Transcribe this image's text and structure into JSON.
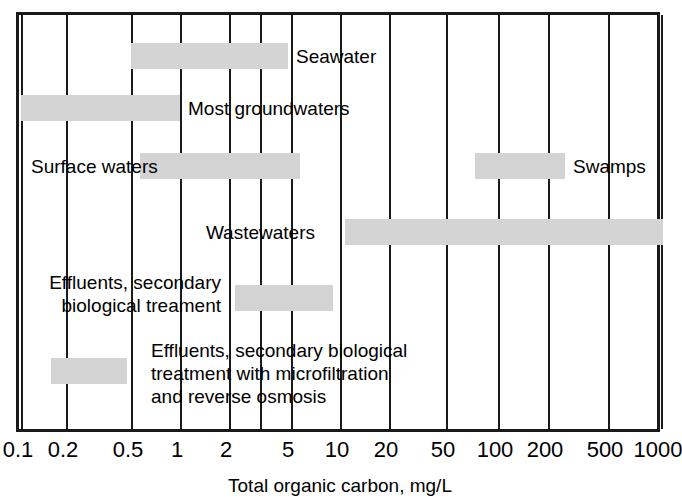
{
  "chart_data": {
    "type": "bar",
    "orientation": "horizontal",
    "title": "",
    "xlabel": "Total organic carbon, mg/L",
    "ylabel": "",
    "xscale": "log",
    "xlim": [
      0.1,
      1000
    ],
    "grid": true,
    "legend": "none",
    "tick_labels": [
      "0.1",
      "0.2",
      "0.5",
      "1",
      "2",
      "5",
      "10",
      "20",
      "50",
      "100",
      "200",
      "500",
      "1000"
    ],
    "tick_values": [
      0.1,
      0.2,
      0.5,
      1,
      2,
      5,
      10,
      20,
      50,
      100,
      200,
      500,
      1000
    ],
    "bar_color": "#d4d4d4",
    "categories": [
      "Seawater",
      "Most groundwaters",
      "Surface waters",
      "Swamps",
      "Wastewaters",
      "Effluents, secondary biological treament",
      "Effluents, secondary biological treatment with microfiltration and reverse osmosis"
    ],
    "ranges": [
      {
        "label": "Seawater",
        "low": 0.5,
        "high": 4.0
      },
      {
        "label": "Most groundwaters",
        "low": 0.1,
        "high": 1.0
      },
      {
        "label": "Surface waters",
        "low": 0.7,
        "high": 10.0
      },
      {
        "label": "Swamps",
        "low": 70.0,
        "high": 220.0
      },
      {
        "label": "Wastewaters",
        "low": 50.0,
        "high": 1000.0
      },
      {
        "label": "Effluents, secondary biological treament",
        "low": 6.0,
        "high": 30.0
      },
      {
        "label": "Effluents, secondary biological treatment with microfiltration and reverse osmosis",
        "low": 0.2,
        "high": 0.75
      }
    ],
    "bars": [
      {
        "name": "seawater",
        "low": 0.5,
        "high": 4.0,
        "x_px": 128,
        "w_px": 157,
        "y_px": 40,
        "label": "Seawater",
        "label_x_px": 293,
        "label_y_px": 42,
        "label_align": "left",
        "label_lines": [
          "Seawater"
        ]
      },
      {
        "name": "most-groundwaters",
        "low": 0.1,
        "high": 1.0,
        "x_px": 18,
        "w_px": 159,
        "y_px": 92,
        "label": "Most groundwaters",
        "label_x_px": 185,
        "label_y_px": 94,
        "label_align": "left",
        "label_lines": [
          "Most groundwaters"
        ]
      },
      {
        "name": "surface-waters",
        "low": 0.7,
        "high": 10.0,
        "x_px": 137,
        "w_px": 160,
        "y_px": 150,
        "label": "Surface waters",
        "label_x_px": 28,
        "label_y_px": 152,
        "label_align": "left",
        "label_lines": [
          "Surface waters"
        ]
      },
      {
        "name": "swamps",
        "low": 70.0,
        "high": 220.0,
        "x_px": 472,
        "w_px": 90,
        "y_px": 150,
        "label": "Swamps",
        "label_x_px": 570,
        "label_y_px": 152,
        "label_align": "left",
        "label_lines": [
          "Swamps"
        ]
      },
      {
        "name": "wastewaters",
        "low": 50.0,
        "high": 1000.0,
        "x_px": 342,
        "w_px": 318,
        "y_px": 216,
        "label": "Wastewaters",
        "label_x_px": 312,
        "label_y_px": 218,
        "label_align": "right",
        "label_lines": [
          "Wastewaters"
        ]
      },
      {
        "name": "effluents-secondary-biological",
        "low": 6.0,
        "high": 30.0,
        "x_px": 232,
        "w_px": 98,
        "y_px": 282,
        "label": "Effluents, secondary biological treament",
        "label_x_px": 218,
        "label_y_px": 268,
        "label_align": "right",
        "label_lines": [
          "Effluents, secondary",
          "biological treament"
        ]
      },
      {
        "name": "effluents-microfiltration-ro",
        "low": 0.2,
        "high": 0.75,
        "x_px": 48,
        "w_px": 76,
        "y_px": 355,
        "label": "Effluents, secondary biological treatment with microfiltration and reverse osmosis",
        "label_x_px": 148,
        "label_y_px": 336,
        "label_align": "left",
        "label_lines": [
          "Effluents, secondary biological",
          "treatment with microfiltration",
          "and reverse osmosis"
        ]
      }
    ]
  },
  "axis": {
    "title": "Total organic carbon, mg/L",
    "ticks": [
      {
        "label": "0.1",
        "value": 0.1,
        "x_px": 18
      },
      {
        "label": "0.2",
        "value": 0.2,
        "x_px": 63
      },
      {
        "label": "0.5",
        "value": 0.5,
        "x_px": 128
      },
      {
        "label": "1",
        "value": 1,
        "x_px": 177
      },
      {
        "label": "2",
        "value": 2,
        "x_px": 226
      },
      {
        "label": "5",
        "value": 5,
        "x_px": 288
      },
      {
        "label": "10",
        "value": 10,
        "x_px": 337
      },
      {
        "label": "20",
        "value": 20,
        "x_px": 386
      },
      {
        "label": "50",
        "value": 50,
        "x_px": 443
      },
      {
        "label": "100",
        "value": 100,
        "x_px": 495
      },
      {
        "label": "200",
        "value": 200,
        "x_px": 545
      },
      {
        "label": "500",
        "value": 500,
        "x_px": 605
      },
      {
        "label": "1000",
        "value": 1000,
        "x_px": 658
      }
    ],
    "extra_gridlines_px": [
      257
    ]
  }
}
